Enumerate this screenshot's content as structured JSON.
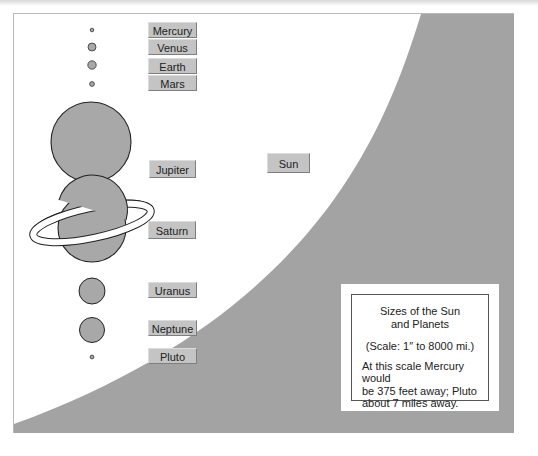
{
  "diagram": {
    "title": "Sizes of the Sun and Planets",
    "title_line1": "Sizes of the Sun",
    "title_line2": "and Planets",
    "scale": "(Scale: 1″ to 8000 mi.)",
    "note_line1": "At this scale Mercury would",
    "note_line2": "be 375 feet away; Pluto",
    "note_line3": "about 7 miles away.",
    "sun_label": "Sun",
    "colors": {
      "sun_gray": "#a3a3a3",
      "planet_fill": "#a8a8a8",
      "planet_stroke": "#333333",
      "label_bg": "#c4c4c4",
      "background": "#ffffff"
    },
    "planets": [
      {
        "name": "Mercury",
        "label": "Mercury",
        "cx": 78,
        "cy": 16,
        "r": 1.7
      },
      {
        "name": "Venus",
        "label": "Venus",
        "cx": 78,
        "cy": 33,
        "r": 4
      },
      {
        "name": "Earth",
        "label": "Earth",
        "cx": 78,
        "cy": 51,
        "r": 4.2
      },
      {
        "name": "Mars",
        "label": "Mars",
        "cx": 78,
        "cy": 70,
        "r": 2.4
      },
      {
        "name": "Jupiter",
        "label": "Jupiter",
        "cx": 77,
        "cy": 128,
        "r": 40
      },
      {
        "name": "Saturn",
        "label": "Saturn",
        "cx": 78,
        "cy": 214,
        "r": 34
      },
      {
        "name": "Uranus",
        "label": "Uranus",
        "cx": 78,
        "cy": 277,
        "r": 13
      },
      {
        "name": "Neptune",
        "label": "Neptune",
        "cx": 78,
        "cy": 316,
        "r": 12.5
      },
      {
        "name": "Pluto",
        "label": "Pluto",
        "cx": 78,
        "cy": 343,
        "r": 1.8
      }
    ]
  }
}
